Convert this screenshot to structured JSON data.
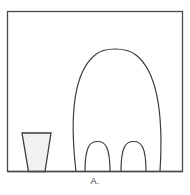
{
  "figure": {
    "caption": "A.",
    "frame": {
      "x": 7.5,
      "y": 11.5,
      "width": 175,
      "height": 160,
      "stroke": "#4a4a4a",
      "stroke_width": 1.3,
      "fill": "#ffffff"
    },
    "baseline_y": 171.5,
    "shapes": [
      {
        "name": "large-dome",
        "role": "animal-body-outline",
        "type": "arch",
        "left_base_x": 76,
        "right_base_x": 160,
        "apex_x": 115,
        "apex_y": 45,
        "stroke": "#3c3c3c",
        "stroke_width": 1.2,
        "fill": "none"
      },
      {
        "name": "small-arch-left",
        "role": "leg-left",
        "type": "arch",
        "left_base_x": 85,
        "right_base_x": 110,
        "apex_x": 97.5,
        "apex_y": 142,
        "stroke": "#3c3c3c",
        "stroke_width": 1.2,
        "fill": "none"
      },
      {
        "name": "small-arch-right",
        "role": "leg-right",
        "type": "arch",
        "left_base_x": 121,
        "right_base_x": 146,
        "apex_x": 133.5,
        "apex_y": 142,
        "stroke": "#3c3c3c",
        "stroke_width": 1.2,
        "fill": "none"
      },
      {
        "name": "cup",
        "role": "tapered-vessel",
        "type": "trapezoid",
        "top_left_x": 22,
        "top_right_x": 51,
        "top_y": 133,
        "bottom_left_x": 28.5,
        "bottom_right_x": 45,
        "bottom_y": 171,
        "stroke": "#3c3c3c",
        "stroke_width": 1.3,
        "fill": "#f1f1ef"
      }
    ]
  }
}
